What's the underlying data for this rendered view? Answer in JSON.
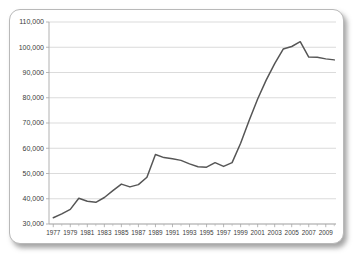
{
  "chart_data": {
    "type": "line",
    "title": "",
    "subtitle": "",
    "xlabel": "",
    "ylabel": "",
    "xlim": [
      1976.5,
      2010.2
    ],
    "ylim": [
      30000,
      110000
    ],
    "grid": true,
    "grid_axis": "y",
    "legend": false,
    "legend_position": "none",
    "line_color": "#565656",
    "grid_color": "#d2d2d2",
    "axis_color": "#a8a8a8",
    "background_color": "#ffffff",
    "y_ticks": [
      30000,
      40000,
      50000,
      60000,
      70000,
      80000,
      90000,
      100000,
      110000
    ],
    "y_tick_labels": [
      "30,000",
      "40,000",
      "50,000",
      "60,000",
      "70,000",
      "80,000",
      "90,000",
      "100,000",
      "110,000"
    ],
    "x_ticks": [
      1977,
      1979,
      1981,
      1983,
      1985,
      1987,
      1989,
      1991,
      1993,
      1995,
      1997,
      1999,
      2001,
      2003,
      2005,
      2007,
      2009
    ],
    "x_tick_labels": [
      "1977",
      "1979",
      "1981",
      "1983",
      "1985",
      "1987",
      "1989",
      "1991",
      "1993",
      "1995",
      "1997",
      "1999",
      "2001",
      "2003",
      "2005",
      "2007",
      "2009"
    ],
    "x_minor_ticks": [
      1978,
      1980,
      1982,
      1984,
      1986,
      1988,
      1990,
      1992,
      1994,
      1996,
      1998,
      2000,
      2002,
      2004,
      2006,
      2008,
      2010
    ],
    "x": [
      1977,
      1978,
      1979,
      1980,
      1981,
      1982,
      1983,
      1984,
      1985,
      1986,
      1987,
      1988,
      1989,
      1990,
      1991,
      1992,
      1993,
      1994,
      1995,
      1996,
      1997,
      1998,
      1999,
      2000,
      2001,
      2002,
      2003,
      2004,
      2005,
      2006,
      2007,
      2008,
      2009,
      2010
    ],
    "values": [
      32500,
      34000,
      35800,
      40200,
      39000,
      38600,
      40500,
      43200,
      45800,
      44700,
      45600,
      48500,
      57500,
      56300,
      55800,
      55200,
      53800,
      52700,
      52500,
      54300,
      52800,
      54300,
      62000,
      71000,
      79500,
      87000,
      93500,
      99300,
      100300,
      102200,
      96100,
      96000,
      95400,
      95000
    ],
    "series": [
      {
        "name": "series-1",
        "values": [
          32500,
          34000,
          35800,
          40200,
          39000,
          38600,
          40500,
          43200,
          45800,
          44700,
          45600,
          48500,
          57500,
          56300,
          55800,
          55200,
          53800,
          52700,
          52500,
          54300,
          52800,
          54300,
          62000,
          71000,
          79500,
          87000,
          93500,
          99300,
          100300,
          102200,
          96100,
          96000,
          95400,
          95000
        ]
      }
    ]
  }
}
